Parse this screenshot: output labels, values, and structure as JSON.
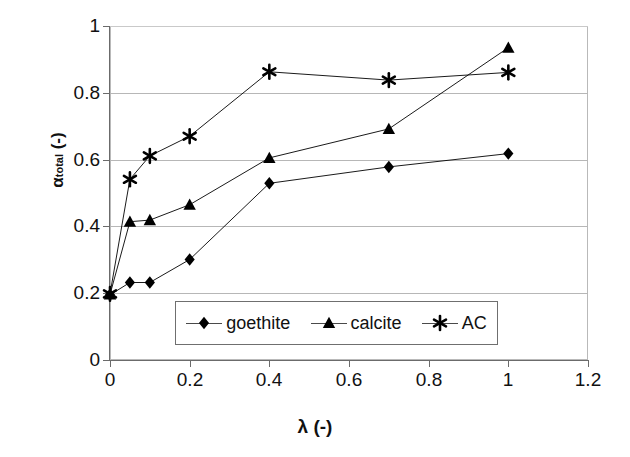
{
  "chart_data": {
    "type": "line",
    "title": "",
    "xlabel": "λ (-)",
    "ylabel": "αtotal (-)",
    "ylabel_base": "α",
    "ylabel_sub": "total",
    "ylabel_unit": " (-)",
    "xlim": [
      0,
      1.2
    ],
    "ylim": [
      0,
      1
    ],
    "xticks": [
      "0",
      "0.2",
      "0.4",
      "0.6",
      "0.8",
      "1",
      "1.2"
    ],
    "xtick_values": [
      0,
      0.2,
      0.4,
      0.6,
      0.8,
      1,
      1.2
    ],
    "yticks": [
      "0",
      "0.2",
      "0.4",
      "0.6",
      "0.8",
      "1"
    ],
    "ytick_values": [
      0,
      0.2,
      0.4,
      0.6,
      0.8,
      1
    ],
    "grid": "horizontal",
    "legend_position": "inside-bottom-center",
    "x": [
      0,
      0.05,
      0.1,
      0.2,
      0.4,
      0.7,
      1.0
    ],
    "series": [
      {
        "name": "goethite",
        "marker": "diamond",
        "values": [
          0.195,
          0.232,
          0.232,
          0.301,
          0.529,
          0.578,
          0.618
        ]
      },
      {
        "name": "calcite",
        "marker": "triangle",
        "values": [
          0.196,
          0.414,
          0.419,
          0.465,
          0.605,
          0.692,
          0.935
        ]
      },
      {
        "name": "AC",
        "marker": "asterisk",
        "values": [
          0.198,
          0.541,
          0.611,
          0.67,
          0.863,
          0.838,
          0.861
        ]
      }
    ]
  },
  "legend": {
    "items": [
      {
        "label": "goethite",
        "marker": "diamond"
      },
      {
        "label": "calcite",
        "marker": "triangle"
      },
      {
        "label": "AC",
        "marker": "asterisk"
      }
    ]
  },
  "colors": {
    "series": "#000000",
    "axis": "#6b6b6b",
    "grid": "#b7b7b7",
    "frame": "#b9b9b9",
    "background": "#ffffff"
  }
}
